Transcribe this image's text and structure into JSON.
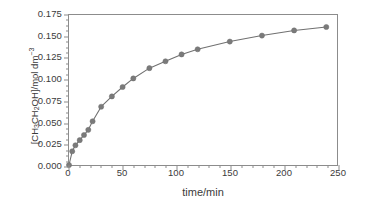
{
  "chart_data": {
    "type": "line",
    "title": "",
    "xlabel": "time/min",
    "ylabel": "[CH3CH2OH]/mol dm-3",
    "ylabel_parts": {
      "prefix": "[CH",
      "sub1": "3",
      "mid": "CH",
      "sub2": "2",
      "suffix": "OH]/mol dm",
      "sup": "−3"
    },
    "xlim": [
      0,
      250
    ],
    "ylim": [
      0.0,
      0.175
    ],
    "x_major_step": 50,
    "x_minor_step": 10,
    "y_major_step": 0.025,
    "y_minor_step": 0.00625,
    "grid": false,
    "legend": "none",
    "xticks": [
      0,
      50,
      100,
      150,
      200,
      250
    ],
    "xtick_labels": [
      "0",
      "50",
      "100",
      "150",
      "200",
      "250"
    ],
    "yticks": [
      0.0,
      0.025,
      0.05,
      0.075,
      0.1,
      0.125,
      0.15,
      0.175
    ],
    "ytick_labels": [
      "0.000",
      "0.025",
      "0.050",
      "0.075",
      "0.100",
      "0.125",
      "0.150",
      "0.175"
    ],
    "series": [
      {
        "name": "ethanol concentration",
        "marker": "circle",
        "marker_color": "#7a7a7a",
        "line_color": "#707070",
        "x": [
          0,
          3,
          6,
          10,
          14,
          18,
          22,
          30,
          40,
          50,
          60,
          75,
          90,
          105,
          120,
          150,
          180,
          210,
          240
        ],
        "y": [
          0.0,
          0.016,
          0.023,
          0.029,
          0.035,
          0.041,
          0.051,
          0.068,
          0.08,
          0.091,
          0.101,
          0.113,
          0.121,
          0.129,
          0.135,
          0.144,
          0.151,
          0.157,
          0.161
        ]
      }
    ]
  },
  "colors": {
    "axis": "#8c8c8c",
    "text": "#3b3b3b",
    "marker": "#7a7a7a",
    "line": "#707070",
    "background": "#ffffff"
  }
}
